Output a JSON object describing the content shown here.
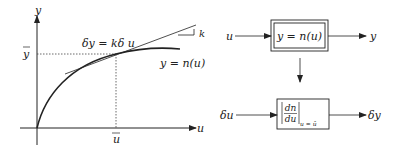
{
  "graph": {
    "y_axis_label": "y",
    "x_axis_label": "u",
    "y_bar_label": "y",
    "u_bar_label": "u",
    "tangent_equation": "δy = kδ u",
    "curve_equation": "y = n(u)",
    "slope_label": "k"
  },
  "block_diagram": {
    "nonlinear_input": "u",
    "nonlinear_block": "y = n(u)",
    "nonlinear_output": "y",
    "linear_input": "δu",
    "linear_block_num": "dn",
    "linear_block_den": "du",
    "linear_block_subscript": "u = ū",
    "linear_output": "δy"
  }
}
